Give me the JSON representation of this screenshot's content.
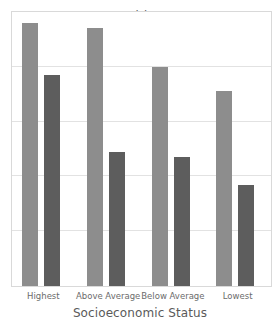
{
  "chart_data": {
    "type": "bar",
    "title": "Girls",
    "xlabel": "Socioeconomic Status",
    "ylabel": "",
    "categories": [
      "Highest",
      "Above Average",
      "Below Average",
      "Lowest"
    ],
    "series": [
      {
        "name": "light-series",
        "color": "#8d8d8d",
        "values": [
          96,
          94,
          80,
          71
        ]
      },
      {
        "name": "dark-series",
        "color": "#5d5d5d",
        "values": [
          77,
          49,
          47,
          37
        ]
      }
    ],
    "ylim": [
      0,
      100
    ],
    "yticks": [
      0,
      20,
      40,
      60,
      80,
      100
    ],
    "ytick_labels": [
      "",
      "",
      "",
      "",
      "",
      ""
    ],
    "grid": true,
    "grid_axis": "y",
    "legend": false,
    "legend_position": "none",
    "annotations": []
  },
  "style": {
    "background": "#ffffff",
    "plot_border_color": "#d9d9d9",
    "gridline_color": "#e2e2e2",
    "title_color": "#5a5a5a",
    "tick_color": "#6b6b6b"
  }
}
